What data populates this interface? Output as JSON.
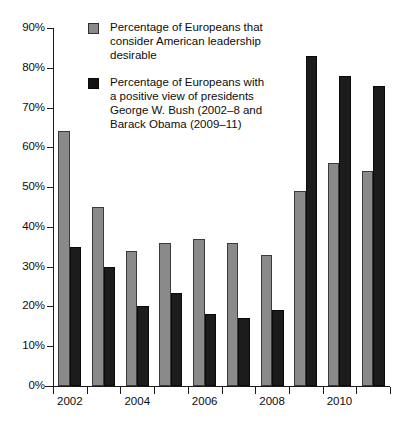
{
  "chart_data": {
    "type": "bar",
    "title": "",
    "xlabel": "",
    "ylabel": "",
    "ylim": [
      0,
      90
    ],
    "ytick_labels": [
      "0%",
      "10%",
      "20%",
      "30%",
      "40%",
      "50%",
      "60%",
      "70%",
      "80%",
      "90%"
    ],
    "ytick_values": [
      0,
      10,
      20,
      30,
      40,
      50,
      60,
      70,
      80,
      90
    ],
    "grid": false,
    "legend_position": "top-center",
    "categories": [
      "2002",
      "2003",
      "2004",
      "2005",
      "2006",
      "2007",
      "2008",
      "2009",
      "2010",
      "2011"
    ],
    "xtick_labels_shown": [
      "2002",
      "2004",
      "2006",
      "2008",
      "2010"
    ],
    "series": [
      {
        "name": "Percentage of Europeans that consider American leadership desirable",
        "color": "#8a8a8a",
        "values": [
          64,
          45,
          34,
          36,
          37,
          36,
          33,
          49,
          56,
          54
        ]
      },
      {
        "name": "Percentage of Europeans with a positive view of presidents George W. Bush (2002–8 and Barack Obama (2009–11)",
        "color": "#1c1c1c",
        "values": [
          35,
          30,
          20,
          23.5,
          18,
          17,
          19,
          83,
          78,
          75.5
        ]
      }
    ]
  },
  "legend": {
    "items": [
      {
        "swatch": "series-0",
        "lines": [
          "Percentage of Europeans that",
          "consider American leadership",
          "desirable"
        ]
      },
      {
        "swatch": "series-1",
        "lines": [
          "Percentage of Europeans with",
          "a positive view of presidents",
          "George W. Bush (2002–8 and",
          "Barack Obama (2009–11)"
        ]
      }
    ]
  }
}
